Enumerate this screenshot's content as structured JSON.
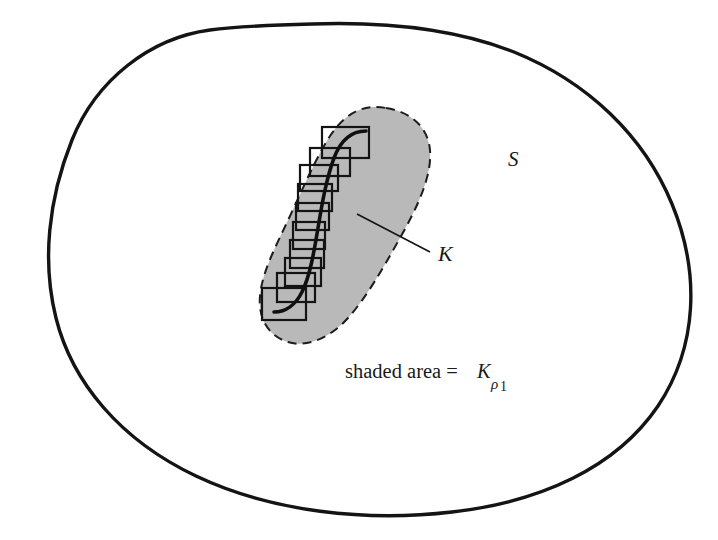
{
  "figure": {
    "kind": "math-diagram",
    "caption_text": "shaded area =",
    "labels": {
      "outer_set": "S",
      "curve": "K",
      "thickened_base": "K",
      "thickened_sub_symbol": "ρ",
      "thickened_sub_index": "1"
    },
    "colors": {
      "background": "#ffffff",
      "ink": "#141414",
      "shade_fill": "#b9b9b9",
      "shade_stroke": "#1c1c1c",
      "box_stroke": "#141414",
      "box_fill": "none",
      "curve_stroke": "#101010",
      "leader_stroke": "#141414"
    },
    "geometry": {
      "outer_boundary_stroke_width": 3.4,
      "shade_boundary_stroke_width": 2.0,
      "shade_boundary_dash": "9 6",
      "curve_stroke_width": 3.6,
      "box_stroke_width": 2.2,
      "leader_stroke_width": 1.6,
      "leader_from": [
        357,
        214
      ],
      "leader_to": [
        430,
        252
      ]
    },
    "boxes": [
      {
        "x": 322,
        "y": 127,
        "w": 47,
        "h": 31
      },
      {
        "x": 310,
        "y": 148,
        "w": 40,
        "h": 28
      },
      {
        "x": 300,
        "y": 165,
        "w": 38,
        "h": 26
      },
      {
        "x": 298,
        "y": 184,
        "w": 34,
        "h": 27
      },
      {
        "x": 296,
        "y": 203,
        "w": 33,
        "h": 27
      },
      {
        "x": 293,
        "y": 222,
        "w": 32,
        "h": 27
      },
      {
        "x": 290,
        "y": 240,
        "w": 34,
        "h": 28
      },
      {
        "x": 285,
        "y": 258,
        "w": 36,
        "h": 28
      },
      {
        "x": 277,
        "y": 273,
        "w": 38,
        "h": 29
      },
      {
        "x": 262,
        "y": 288,
        "w": 44,
        "h": 32
      }
    ]
  }
}
